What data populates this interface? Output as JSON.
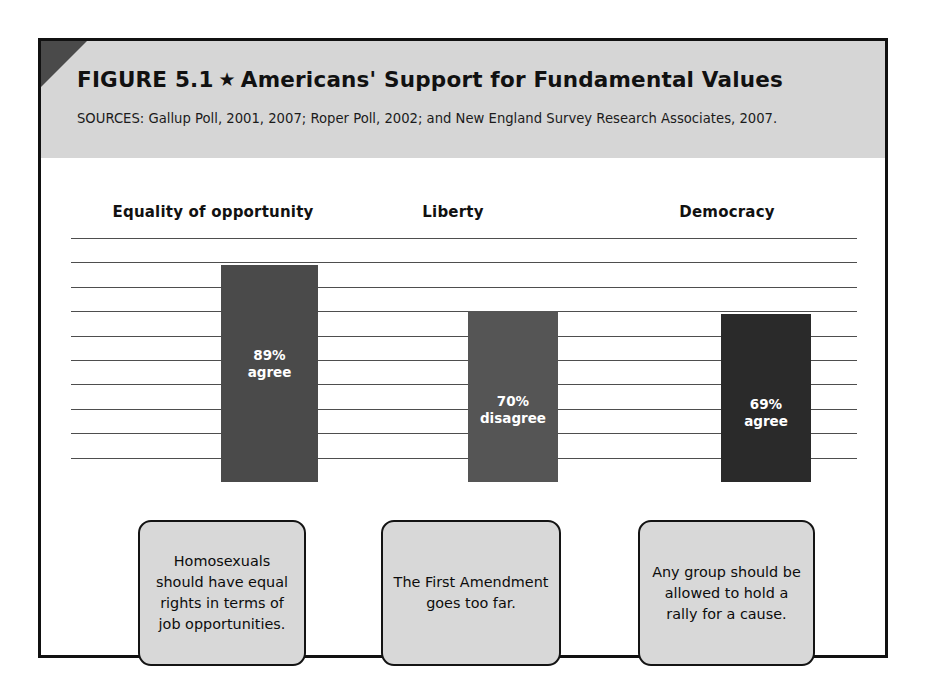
{
  "figure": {
    "number_label": "FIGURE 5.1",
    "star_glyph": "★",
    "title": "Americans' Support for Fundamental Values",
    "sources": "SOURCES: Gallup Poll, 2001, 2007; Roper Poll, 2002; and New England Survey Research Associates, 2007."
  },
  "colors": {
    "header_band": "#d6d6d6",
    "frame_border": "#111111",
    "corner_fold": "#4a4a4a",
    "gridline": "#4e4e4e",
    "caption_fill": "#d8d8d8",
    "bar_1": "#4a4a4a",
    "bar_2": "#555555",
    "bar_3": "#2a2a2a"
  },
  "chart_data": {
    "type": "bar",
    "title": "Americans' Support for Fundamental Values",
    "xlabel": "",
    "ylabel": "",
    "ylim": [
      0,
      100
    ],
    "grid": true,
    "gridline_step": 10,
    "legend": "none",
    "categories": [
      "Equality of opportunity",
      "Liberty",
      "Democracy"
    ],
    "values": [
      89,
      70,
      69
    ],
    "bars": [
      {
        "category": "Equality of opportunity",
        "value": 89,
        "value_label": "89%",
        "response_label": "agree",
        "color": "#4a4a4a",
        "statement": "Homosexuals should have equal rights in terms of job opportunities."
      },
      {
        "category": "Liberty",
        "value": 70,
        "value_label": "70%",
        "response_label": "disagree",
        "color": "#555555",
        "statement": "The First Amendment goes too far."
      },
      {
        "category": "Democracy",
        "value": 69,
        "value_label": "69%",
        "response_label": "agree",
        "color": "#2a2a2a",
        "statement": "Any group should be allowed to hold a rally for a cause."
      }
    ]
  }
}
